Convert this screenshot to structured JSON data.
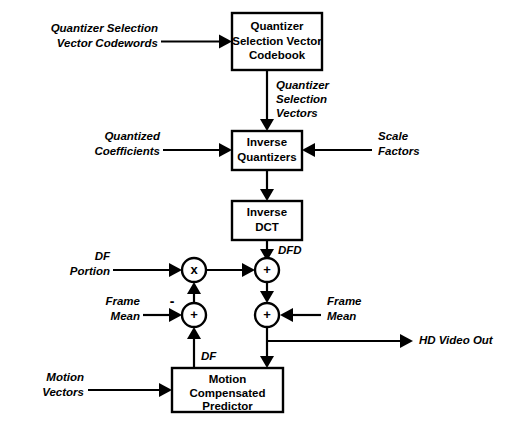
{
  "diagram": {
    "type": "block-diagram",
    "background_color": "#ffffff",
    "line_color": "#000000",
    "blocks": [
      {
        "id": "quantizer-selection-vector-codebook",
        "lines": [
          "Quantizer",
          "Selection Vector",
          "Codebook"
        ]
      },
      {
        "id": "inverse-quantizers",
        "lines": [
          "Inverse",
          "Quantizers"
        ]
      },
      {
        "id": "inverse-dct",
        "lines": [
          "Inverse",
          "DCT"
        ]
      },
      {
        "id": "motion-compensated-predictor",
        "lines": [
          "Motion",
          "Compensated",
          "Predictor"
        ]
      }
    ],
    "operators": [
      {
        "id": "multiplier",
        "glyph": "x"
      },
      {
        "id": "adder-dfd",
        "glyph": "+"
      },
      {
        "id": "adder-frame-mean-left",
        "glyph": "+",
        "sign": "-"
      },
      {
        "id": "adder-frame-mean-right",
        "glyph": "+"
      }
    ],
    "signals": {
      "quantizer_selection_vector_codewords": [
        "Quantizer Selection",
        "Vector Codewords"
      ],
      "quantizer_selection_vectors": [
        "Quantizer",
        "Selection",
        "Vectors"
      ],
      "quantized_coefficients": [
        "Quantized",
        "Coefficients"
      ],
      "scale_factors": [
        "Scale",
        "Factors"
      ],
      "df_portion": [
        "DF",
        "Portion"
      ],
      "dfd": "DFD",
      "frame_mean_left": [
        "Frame",
        "Mean"
      ],
      "frame_mean_right": [
        "Frame",
        "Mean"
      ],
      "hd_video_out": "HD Video Out",
      "df": "DF",
      "motion_vectors": [
        "Motion",
        "Vectors"
      ]
    }
  }
}
